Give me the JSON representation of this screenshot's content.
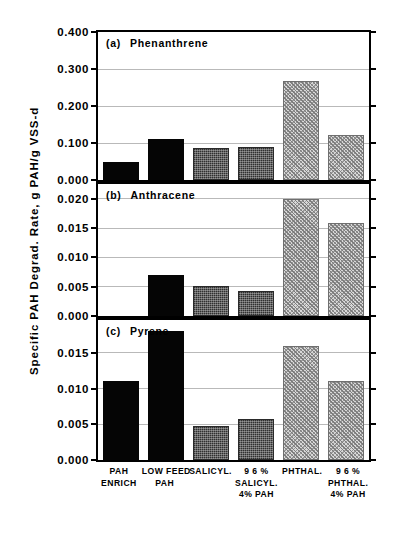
{
  "chart_data": {
    "type": "bar",
    "title": "",
    "ylabel": "Specific PAH Degrad. Rate, g  PAH/g  VSS-d",
    "xlabel": "",
    "grid": true,
    "legend": "none",
    "categories": [
      "PAH ENRICH",
      "LOW FEED PAH",
      "SALICYL.",
      "96% SALICYL. 4% PAH",
      "PHTHAL.",
      "96% PHTHAL. 4% PAH"
    ],
    "category_label_lines": [
      [
        "PAH",
        "ENRICH"
      ],
      [
        "LOW FEED",
        "PAH"
      ],
      [
        "SALICYL."
      ],
      [
        "9 6 %",
        "SALICYL.",
        "4%  PAH"
      ],
      [
        "PHTHAL."
      ],
      [
        "9 6 %",
        "PHTHAL.",
        "4%  PAH"
      ]
    ],
    "bar_fills": [
      "solid",
      "solid",
      "stipple",
      "stipple",
      "hatch",
      "hatch"
    ],
    "fill_colors": {
      "solid": "#050505",
      "stipple": "#4e4e4e",
      "hatch": "#d8d8d8"
    },
    "panels": [
      {
        "id": "(a)",
        "name": "Phenanthrene",
        "ylim": [
          0.0,
          0.4
        ],
        "yticks": [
          0.0,
          0.1,
          0.2,
          0.3,
          0.4
        ],
        "ytick_labels": [
          "0.000",
          "0.100",
          "0.200",
          "0.300",
          "0.400"
        ],
        "values": [
          0.048,
          0.11,
          0.086,
          0.09,
          0.268,
          0.123
        ]
      },
      {
        "id": "(b)",
        "name": "Anthracene",
        "ylim": [
          0.0,
          0.0225
        ],
        "yticks": [
          0.0,
          0.005,
          0.01,
          0.015,
          0.02
        ],
        "ytick_labels": [
          "0.000",
          "0.005",
          "0.010",
          "0.015",
          "0.020"
        ],
        "values": [
          0.0,
          0.007,
          0.0052,
          0.0042,
          0.02,
          0.0159
        ]
      },
      {
        "id": "(c)",
        "name": "Pyrene",
        "ylim": [
          0.0,
          0.0196
        ],
        "yticks": [
          0.0,
          0.005,
          0.01,
          0.015
        ],
        "ytick_labels": [
          "0.000",
          "0.005",
          "0.010",
          "0.015"
        ],
        "values": [
          0.011,
          0.018,
          0.0048,
          0.0058,
          0.016,
          0.011
        ]
      }
    ]
  }
}
